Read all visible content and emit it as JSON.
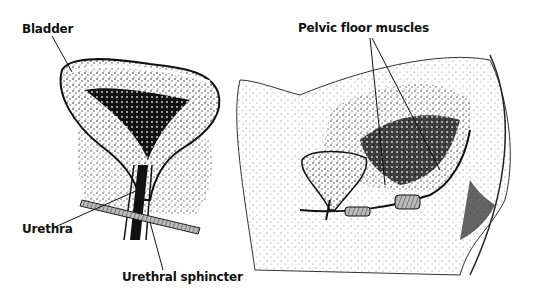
{
  "diagram": {
    "left_panel": {
      "title": "Bladder and urethra (front view)",
      "labels": {
        "bladder": "Bladder",
        "urethra": "Urethra",
        "urethral_sphincter": "Urethral sphincter"
      }
    },
    "right_panel": {
      "title": "Pelvis (side view)",
      "labels": {
        "pelvic_floor_muscles": "Pelvic floor muscles"
      }
    },
    "colors": {
      "ink": "#111111",
      "background": "#ffffff"
    }
  }
}
